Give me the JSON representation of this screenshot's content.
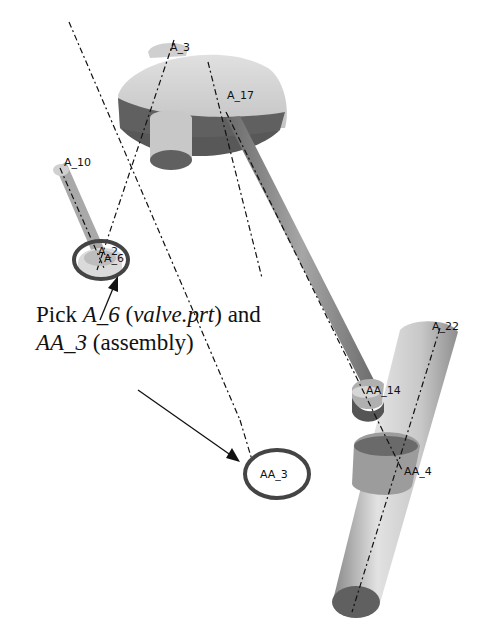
{
  "diagram": {
    "axis_labels": {
      "a3": "A_3",
      "a17": "A_17",
      "a10": "A_10",
      "a2": "A_2",
      "a6": "A_6",
      "a22": "A_22",
      "aa14": "AA_14",
      "aa4": "AA_4",
      "aa3": "AA_3"
    },
    "caption": {
      "line1_prefix": "Pick ",
      "line1_axis": "A_6",
      "line1_open": " (",
      "line1_part": "valve.prt",
      "line1_close": ") and",
      "line2_axis": "AA_3",
      "line2_rest": " (assembly)"
    },
    "highlight_color": "#444444",
    "part_colors": {
      "light": "#d4d4d4",
      "mid": "#9a9a9a",
      "dark": "#5c5c5c"
    }
  }
}
